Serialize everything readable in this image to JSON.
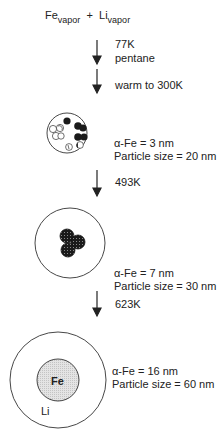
{
  "title": {
    "reactant1": "Fe",
    "reactant1_sub": "vapor",
    "plus": "+",
    "reactant2": "Li",
    "reactant2_sub": "vapor"
  },
  "steps": [
    {
      "lines": [
        "77K",
        "pentane"
      ]
    },
    {
      "lines": [
        "warm to 300K"
      ]
    },
    {
      "lines": [
        "493K"
      ]
    },
    {
      "lines": [
        "623K"
      ]
    }
  ],
  "stages": [
    {
      "alpha_fe": "α-Fe = 3 nm",
      "particle_size": "Particle size = 20 nm"
    },
    {
      "alpha_fe": "α-Fe = 7 nm",
      "particle_size": "Particle size = 30 nm"
    },
    {
      "alpha_fe": "α-Fe = 16 nm",
      "particle_size": "Particle size = 60 nm",
      "core_label": "Fe",
      "shell_label": "Li"
    }
  ],
  "colors": {
    "line": "#333333",
    "dark_particle": "#1a1a1a",
    "core_fill": "#d9d9d9"
  }
}
